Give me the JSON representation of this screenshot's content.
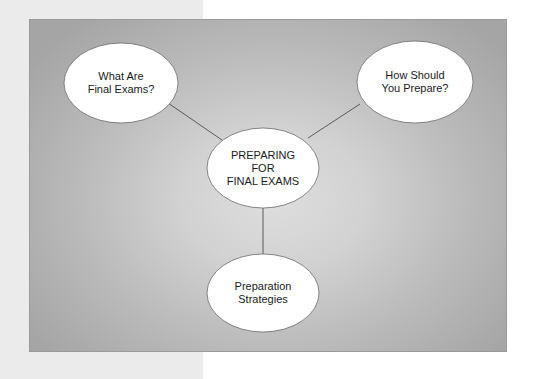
{
  "diagram": {
    "type": "concept-map",
    "center_node": {
      "label": "PREPARING\nFOR\nFINAL EXAMS",
      "cx": 263,
      "cy": 168,
      "rx": 56,
      "ry": 40
    },
    "nodes": [
      {
        "id": "what",
        "label": "What Are\nFinal Exams?",
        "cx": 121,
        "cy": 83,
        "rx": 57,
        "ry": 40
      },
      {
        "id": "how",
        "label": "How Should\nYou Prepare?",
        "cx": 415,
        "cy": 82,
        "rx": 58,
        "ry": 41
      },
      {
        "id": "strategies",
        "label": "Preparation\nStrategies",
        "cx": 263,
        "cy": 293,
        "rx": 56,
        "ry": 39
      }
    ],
    "edges": [
      {
        "from": "center",
        "to": "what",
        "x1": 222,
        "y1": 140,
        "x2": 168,
        "y2": 103
      },
      {
        "from": "center",
        "to": "how",
        "x1": 308,
        "y1": 138,
        "x2": 360,
        "y2": 104
      },
      {
        "from": "center",
        "to": "strategies",
        "x1": 263,
        "y1": 208,
        "x2": 263,
        "y2": 254
      }
    ]
  },
  "colors": {
    "node_fill": "#ffffff",
    "node_stroke": "#6a6a6a",
    "edge": "#5a5a5a",
    "panel_center": "#dedede",
    "panel_edge": "#a5a5a5",
    "left_strip": "#ebebeb"
  }
}
